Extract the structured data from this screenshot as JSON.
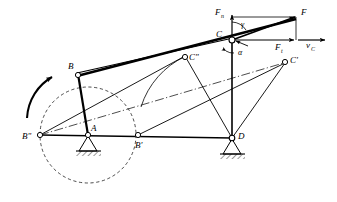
{
  "figure": {
    "type": "kinematic-linkage-diagram",
    "canvas": {
      "width": 337,
      "height": 202
    },
    "colors": {
      "stroke": "#000000",
      "background": "#ffffff",
      "construction": "#000000"
    }
  },
  "labels": {
    "B": "B",
    "B_prime": "B'",
    "B_double_prime": "B\"",
    "A": "A",
    "C": "C",
    "C_prime": "C'",
    "C_double_prime": "C\"",
    "D": "D",
    "F": "F",
    "F_n_base": "F",
    "F_n_sub": "n",
    "F_t_base": "F",
    "F_t_sub": "t",
    "v_c_base": "v",
    "v_c_sub": "C",
    "gamma": "γ",
    "alpha": "α"
  },
  "nodes": [
    {
      "name": "B",
      "label": "B",
      "x": 78,
      "y": 74,
      "pivot": "moving"
    },
    {
      "name": "A",
      "label": "A",
      "x": 88,
      "y": 135,
      "pivot": "fixed-ground"
    },
    {
      "name": "B'",
      "label": "B'",
      "x": 138,
      "y": 135,
      "pivot": "moving"
    },
    {
      "name": "B\"",
      "label": "B\"",
      "x": 40,
      "y": 135,
      "pivot": "moving"
    },
    {
      "name": "C",
      "label": "C",
      "x": 232,
      "y": 39,
      "pivot": "moving"
    },
    {
      "name": "C\"",
      "label": "C\"",
      "x": 185,
      "y": 56,
      "pivot": "moving"
    },
    {
      "name": "C'",
      "label": "C'",
      "x": 285,
      "y": 63,
      "pivot": "moving"
    },
    {
      "name": "D",
      "label": "D",
      "x": 232,
      "y": 138,
      "pivot": "fixed-ground"
    },
    {
      "name": "F",
      "label": "F",
      "x": 296,
      "y": 18,
      "pivot": "force-tip"
    }
  ],
  "crank_circle": {
    "center_x": 88,
    "center_y": 135,
    "radius": 48,
    "style": "dashed"
  },
  "rotation_arrow": {
    "description": "counterclockwise rotation indicator of crank AB",
    "direction": "counter-clockwise"
  },
  "force_vectors": [
    {
      "name": "F",
      "from": "C",
      "to_x": 296,
      "to_y": 18,
      "label": "F",
      "kind": "resultant"
    },
    {
      "name": "F_n",
      "from": "C",
      "to_x": 232,
      "to_y": 17,
      "label": "Fn",
      "kind": "normal-component"
    },
    {
      "name": "F_t",
      "from": "C",
      "to_x": 296,
      "to_y": 40,
      "label": "Ft",
      "kind": "tangential-component"
    },
    {
      "name": "v_C",
      "from": "C",
      "to_x": 324,
      "to_y": 40,
      "label": "vC",
      "kind": "velocity"
    }
  ],
  "angles": [
    {
      "name": "gamma",
      "label": "γ",
      "at": "C",
      "between": "F_n and F"
    },
    {
      "name": "alpha",
      "label": "α",
      "at": "C",
      "between": "CD and F_t"
    }
  ],
  "links": [
    {
      "name": "crank-AB",
      "from": "A",
      "to": "B",
      "style": "thick-solid"
    },
    {
      "name": "coupler-B-C-F",
      "from": "B",
      "to": "F",
      "style": "thick-solid"
    },
    {
      "name": "rocker-CD",
      "from": "C",
      "to": "D",
      "style": "solid"
    },
    {
      "name": "link-D-Cpp",
      "from": "D",
      "to": "C\"",
      "style": "solid"
    },
    {
      "name": "link-D-Cp",
      "from": "D",
      "to": "C'",
      "style": "solid"
    },
    {
      "name": "link-Bpp-Cpp",
      "from": "B\"",
      "to": "C\"",
      "style": "solid"
    },
    {
      "name": "link-Bp-Cp",
      "from": "B'",
      "to": "C'",
      "style": "solid"
    },
    {
      "name": "ground-line",
      "from": "B\"",
      "to": "D",
      "style": "solid-horizontal"
    },
    {
      "name": "centerline",
      "from": "B\"",
      "to": "C'",
      "style": "dash-dot"
    }
  ],
  "supports": [
    {
      "name": "support-A",
      "x": 88,
      "y": 135,
      "type": "pin-hatched"
    },
    {
      "name": "support-D",
      "x": 232,
      "y": 138,
      "type": "pin-hatched"
    }
  ],
  "arc_path": {
    "name": "coupler-trajectory-arc",
    "description": "arc traced showing path swept toward C\""
  }
}
